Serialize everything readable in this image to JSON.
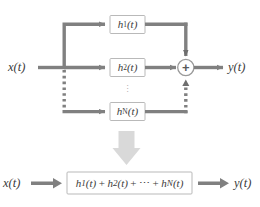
{
  "diagram": {
    "colors": {
      "line": "#808080",
      "line_dark": "#6e6e6e",
      "box_border": "#b9b9b9",
      "box_fill": "#ffffff",
      "big_arrow": "#d9d9d9",
      "text": "#3b3b3b",
      "dots": "#9a9a9a",
      "background": "#ffffff"
    },
    "top": {
      "input_label": "x(t)",
      "output_label": "y(t)",
      "blocks": [
        {
          "id": "h1",
          "base": "h",
          "sub": "1",
          "arg": "(t)",
          "label": "h₁(t)"
        },
        {
          "id": "h2",
          "base": "h",
          "sub": "2",
          "arg": "(t)",
          "label": "h₂(t)"
        },
        {
          "id": "hN",
          "base": "h",
          "sub": "N",
          "arg": "(t)",
          "label": "hₙ(t)"
        }
      ],
      "summing_junction": {
        "symbol": "+",
        "name": "adder"
      },
      "vertical_ellipsis": "⋮",
      "branch_styles": {
        "h1_path": "solid",
        "h2_path": "solid",
        "hN_path": "dotted"
      }
    },
    "transition_arrow": {
      "direction": "down",
      "name": "equivalence-arrow"
    },
    "bottom": {
      "input_label": "x(t)",
      "output_label": "y(t)",
      "expression": "h₁(t) + h₂(t) + ⋯ + hₙ(t)",
      "expression_parts": [
        {
          "type": "term",
          "base": "h",
          "sub": "1",
          "arg": "(t)"
        },
        {
          "type": "op",
          "text": "+"
        },
        {
          "type": "term",
          "base": "h",
          "sub": "2",
          "arg": "(t)"
        },
        {
          "type": "op",
          "text": "+"
        },
        {
          "type": "op",
          "text": "⋯"
        },
        {
          "type": "op",
          "text": "+"
        },
        {
          "type": "term",
          "base": "h",
          "sub": "N",
          "arg": "(t)"
        }
      ]
    }
  }
}
